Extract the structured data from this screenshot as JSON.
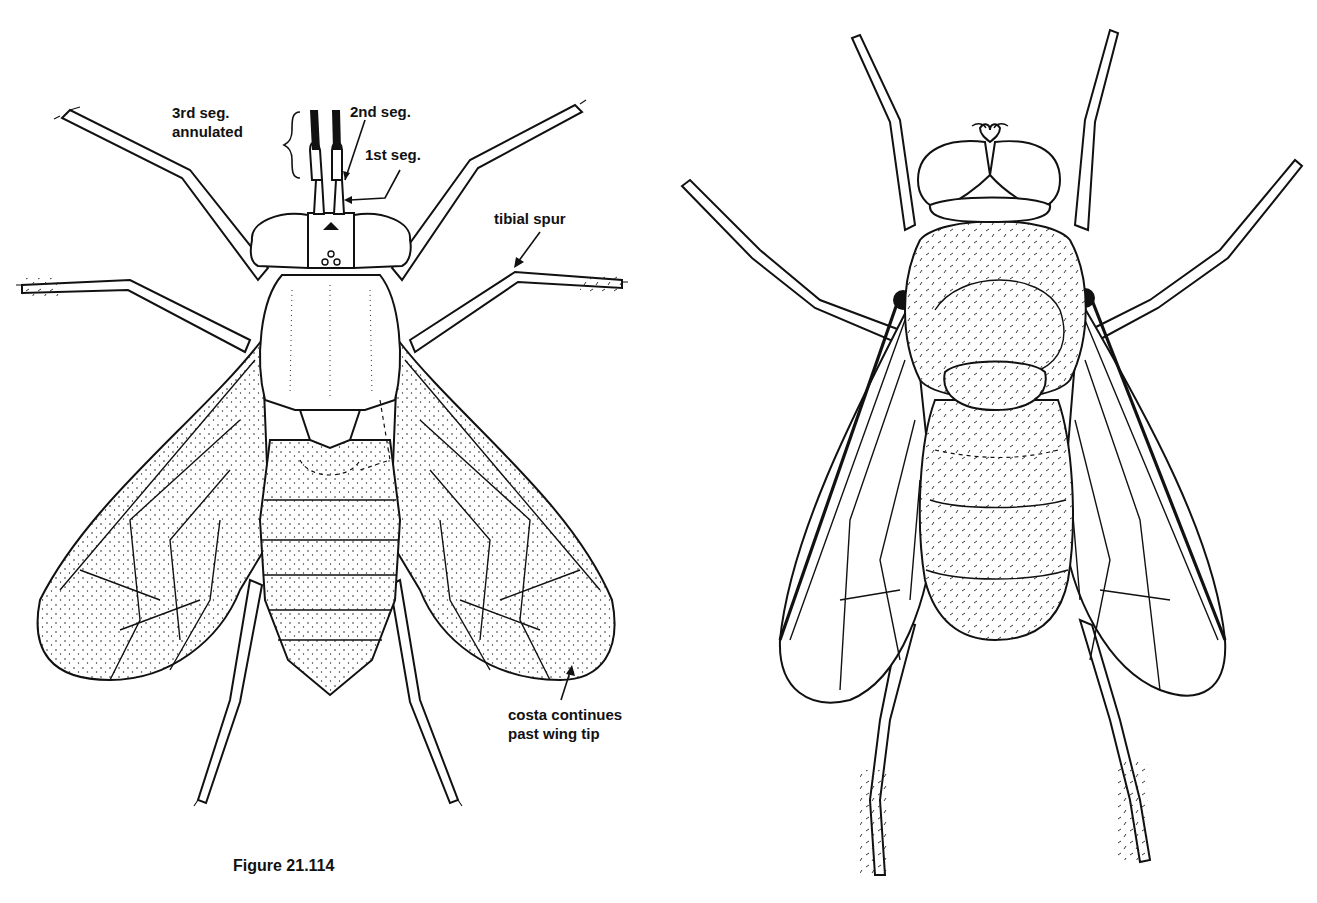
{
  "figure": {
    "caption": "Figure 21.114",
    "left_specimen": {
      "description": "Dorsal view of fly with stippled wings, annulated antennae",
      "labels": {
        "third_segment": [
          "3rd seg.",
          "annulated"
        ],
        "second_segment": "2nd seg.",
        "first_segment": "1st seg.",
        "tibial_spur": "tibial spur",
        "costa": [
          "costa continues",
          "past wing tip"
        ]
      }
    },
    "right_specimen": {
      "description": "Dorsal view of hairy fly with clear wings"
    },
    "colors": {
      "ink": "#111111",
      "paper": "#ffffff"
    }
  }
}
